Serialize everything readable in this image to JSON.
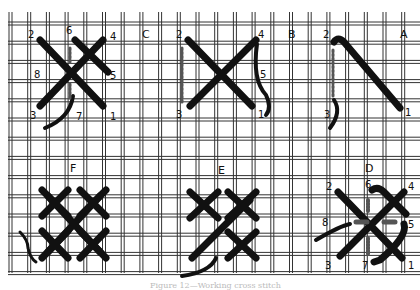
{
  "diagram": {
    "type": "needlework-canvas-cross-stitch",
    "background": "#ffffff",
    "ink": "#111111",
    "panels": [
      {
        "label": "A",
        "numbers": [
          "2",
          "1",
          "3"
        ]
      },
      {
        "label": "B",
        "numbers": [
          "2",
          "4",
          "5",
          "1",
          "3"
        ]
      },
      {
        "label": "C",
        "numbers": [
          "2",
          "6",
          "4",
          "8",
          "5",
          "3",
          "7",
          "1"
        ]
      },
      {
        "label": "D",
        "numbers": [
          "2",
          "6",
          "4",
          "8",
          "5",
          "3",
          "7",
          "1"
        ]
      },
      {
        "label": "E",
        "numbers": []
      },
      {
        "label": "F",
        "numbers": []
      }
    ],
    "caption": "Figure 12—Working cross stitch"
  }
}
